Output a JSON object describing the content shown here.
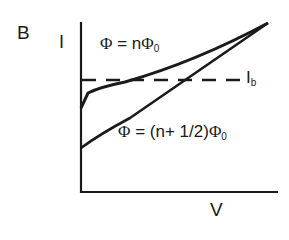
{
  "panel_label": "B",
  "axes": {
    "y_label": "I",
    "x_label": "V"
  },
  "curves": {
    "integer_flux": {
      "phi": "Φ",
      "eq": " = n",
      "phi0": "Φ",
      "sub": "0"
    },
    "half_flux": {
      "phi": "Φ",
      "eq": " = (n+ 1/2)",
      "phi0": "Φ",
      "sub": "0"
    }
  },
  "bias_current": {
    "label": "I",
    "sub": "b"
  },
  "colors": {
    "line": "#1a1a1a",
    "background": "#ffffff"
  }
}
